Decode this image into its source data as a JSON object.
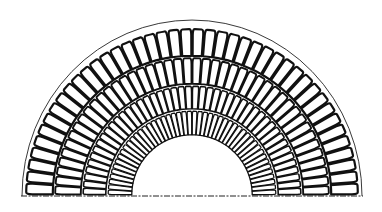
{
  "figure": {
    "title": "Semicircular arch with four concentric rings of voussoirs",
    "canvas": {
      "width": 382,
      "height": 212
    },
    "center": {
      "x": 192,
      "y": 195
    },
    "colors": {
      "background": "#ffffff",
      "line": "#111111"
    },
    "extrados_line": {
      "rx": 170,
      "ry": 176
    },
    "baseline": {
      "x1": 21,
      "x2": 363,
      "y": 196
    },
    "rings": [
      {
        "name": "outer-ring",
        "r_outer": 167,
        "r_inner": 138,
        "bricks": 42,
        "stroke": 2.2
      },
      {
        "name": "second-ring",
        "r_outer": 138,
        "r_inner": 110,
        "bricks": 44,
        "stroke": 1.9
      },
      {
        "name": "third-ring",
        "r_outer": 110,
        "r_inner": 85,
        "bricks": 46,
        "stroke": 1.6
      },
      {
        "name": "inner-ring",
        "r_outer": 85,
        "r_inner": 59,
        "bricks": 48,
        "stroke": 1.3
      }
    ]
  }
}
